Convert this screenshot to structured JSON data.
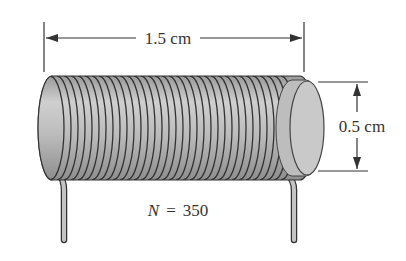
{
  "diagram": {
    "length_label": "1.5 cm",
    "diameter_label": "0.5 cm",
    "turns_label": {
      "symbol": "N",
      "equals": "=",
      "value": "350"
    },
    "colors": {
      "coil": "#b5b5b5",
      "winding_line": "#333333",
      "end_cap": "#c8c8c8",
      "dimension_line": "#333333"
    }
  }
}
